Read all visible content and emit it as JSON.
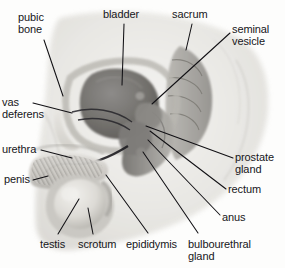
{
  "figure": {
    "name": "male-reproductive-system-sagittal-diagram",
    "view": "mid-sagittal section of the male pelvis",
    "style": "grayscale airbrushed medical illustration on white background",
    "background_color": "#fdfdfc",
    "label_color": "#17161a",
    "leader_line_color": "#111014",
    "width": 285,
    "height": 268
  },
  "labels": [
    {
      "id": "pubic-bone",
      "text": "pubic\nbone",
      "x": 18,
      "y": 12,
      "align": "left"
    },
    {
      "id": "bladder",
      "text": "bladder",
      "x": 103,
      "y": 9,
      "align": "left"
    },
    {
      "id": "sacrum",
      "text": "sacrum",
      "x": 172,
      "y": 9,
      "align": "left"
    },
    {
      "id": "seminal-vesicle",
      "text": "seminal\nvesicle",
      "x": 232,
      "y": 24,
      "align": "left"
    },
    {
      "id": "vas-deferens",
      "text": "vas\ndeferens",
      "x": 2,
      "y": 97,
      "align": "left"
    },
    {
      "id": "urethra",
      "text": "urethra",
      "x": 2,
      "y": 144,
      "align": "left"
    },
    {
      "id": "penis",
      "text": "penis",
      "x": 4,
      "y": 174,
      "align": "left"
    },
    {
      "id": "prostate-gland",
      "text": "prostate\ngland",
      "x": 235,
      "y": 152,
      "align": "left"
    },
    {
      "id": "rectum",
      "text": "rectum",
      "x": 228,
      "y": 184,
      "align": "left"
    },
    {
      "id": "anus",
      "text": "anus",
      "x": 222,
      "y": 212,
      "align": "left"
    },
    {
      "id": "testis",
      "text": "testis",
      "x": 40,
      "y": 239,
      "align": "left"
    },
    {
      "id": "scrotum",
      "text": "scrotum",
      "x": 78,
      "y": 239,
      "align": "left"
    },
    {
      "id": "epididymis",
      "text": "epididymis",
      "x": 126,
      "y": 239,
      "align": "left"
    },
    {
      "id": "bulbourethral",
      "text": "bulbourethral\ngland",
      "x": 188,
      "y": 239,
      "align": "left"
    }
  ],
  "leader_lines": [
    {
      "id": "pubic-bone-leader",
      "points": "44,40 63,96"
    },
    {
      "id": "bladder-leader",
      "points": "124,24 122,85"
    },
    {
      "id": "sacrum-leader",
      "points": "192,24 186,50"
    },
    {
      "id": "seminal-vesicle-leader",
      "points": "230,33 152,104"
    },
    {
      "id": "vas-deferens-leader",
      "points": "33,103 72,113"
    },
    {
      "id": "urethra-leader",
      "points": "41,150 72,158"
    },
    {
      "id": "penis-leader",
      "points": "33,180 48,176"
    },
    {
      "id": "prostate-gland-leader",
      "points": "233,158 146,126"
    },
    {
      "id": "rectum-leader",
      "points": "226,189 150,131"
    },
    {
      "id": "anus-leader",
      "points": "220,215 148,140"
    },
    {
      "id": "testis-leader",
      "points": "58,234 79,199"
    },
    {
      "id": "scrotum-leader",
      "points": "93,234 88,208"
    },
    {
      "id": "epididymis-leader",
      "points": "148,233 106,175"
    },
    {
      "id": "bulbourethral-leader",
      "points": "198,233 143,152"
    }
  ],
  "anatomy_regions": [
    {
      "id": "body-silhouette",
      "label": "torso and thigh outline",
      "tone": "#e9e8e5"
    },
    {
      "id": "pubic-bone",
      "label": "pubic bone",
      "tone": "#d6d4cf"
    },
    {
      "id": "bladder",
      "label": "bladder",
      "tone": "#6f6d6c"
    },
    {
      "id": "sacrum",
      "label": "sacrum",
      "tone": "#9d9b97"
    },
    {
      "id": "rectum",
      "label": "rectum",
      "tone": "#8a8885"
    },
    {
      "id": "prostate-gland",
      "label": "prostate gland",
      "tone": "#7b7976"
    },
    {
      "id": "seminal-vesicle",
      "label": "seminal vesicle",
      "tone": "#858380"
    },
    {
      "id": "penis",
      "label": "penis shaft",
      "tone": "#cfcdc8"
    },
    {
      "id": "testis",
      "label": "testis",
      "tone": "#dddbd6"
    },
    {
      "id": "scrotum",
      "label": "scrotum",
      "tone": "#c9c7c2"
    }
  ]
}
